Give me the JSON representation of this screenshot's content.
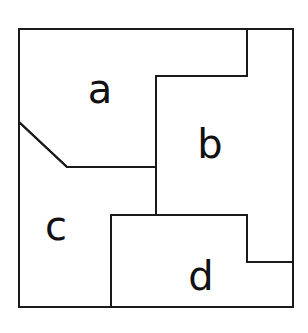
{
  "diagram": {
    "type": "partitioned-square",
    "background": "#ffffff",
    "stroke_color": "#1a1a1a",
    "outer_border": {
      "x1": 19,
      "y1": 29,
      "x2": 293,
      "y2": 307
    },
    "regions": [
      {
        "id": "a",
        "label": "a",
        "label_pos": [
          100,
          103
        ],
        "polygon": [
          [
            19,
            29
          ],
          [
            247,
            29
          ],
          [
            247,
            76
          ],
          [
            156,
            76
          ],
          [
            156,
            167
          ],
          [
            67,
            167
          ],
          [
            19,
            122
          ]
        ]
      },
      {
        "id": "b",
        "label": "b",
        "label_pos": [
          210,
          158
        ],
        "polygon": [
          [
            247,
            29
          ],
          [
            293,
            29
          ],
          [
            293,
            262
          ],
          [
            247,
            262
          ],
          [
            247,
            215
          ],
          [
            156,
            215
          ],
          [
            156,
            76
          ],
          [
            247,
            76
          ]
        ]
      },
      {
        "id": "c",
        "label": "c",
        "label_pos": [
          56,
          240
        ],
        "polygon": [
          [
            19,
            122
          ],
          [
            67,
            167
          ],
          [
            156,
            167
          ],
          [
            156,
            215
          ],
          [
            111,
            215
          ],
          [
            111,
            307
          ],
          [
            19,
            307
          ]
        ]
      },
      {
        "id": "d",
        "label": "d",
        "label_pos": [
          201,
          290
        ],
        "polygon": [
          [
            111,
            215
          ],
          [
            247,
            215
          ],
          [
            247,
            262
          ],
          [
            293,
            262
          ],
          [
            293,
            307
          ],
          [
            111,
            307
          ]
        ]
      }
    ]
  }
}
